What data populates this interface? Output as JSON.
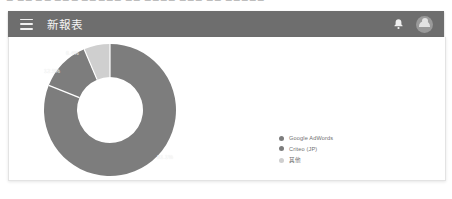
{
  "top_sliver": {
    "text": "▭ ▭▭ ▭▭ ▭▭▭ ▭▭▭▭▭  ▭▭  ▭▭▭▭ ▭▭▭ ▭▭  ▭▭▭▭▭"
  },
  "appbar": {
    "menu_icon": "hamburger-menu-icon",
    "title": "新報表",
    "notification_icon": "bell-icon",
    "avatar_icon": "user-avatar-icon",
    "background_color": "#6e6e6e"
  },
  "card": {
    "background_color": "#ffffff",
    "border_color": "#e3e3e3"
  },
  "chart_data": {
    "type": "pie",
    "variant": "donut",
    "title": "",
    "labels": [
      "Google AdWords",
      "Criteo (JP)",
      "其他"
    ],
    "values": [
      81.1,
      12.5,
      6.4
    ],
    "value_labels": [
      "81.1%",
      "12.5%",
      "6.4%"
    ],
    "colors": [
      "#7d7d7d",
      "#7d7d7d",
      "#cfcfcf"
    ],
    "legend_position": "right",
    "grid": false,
    "xlabel": "",
    "ylabel": ""
  },
  "legend": {
    "items": [
      {
        "label": "Google AdWords",
        "color": "#7d7d7d"
      },
      {
        "label": "Criteo (JP)",
        "color": "#7d7d7d"
      },
      {
        "label": "其他",
        "color": "#cfcfcf"
      }
    ]
  }
}
